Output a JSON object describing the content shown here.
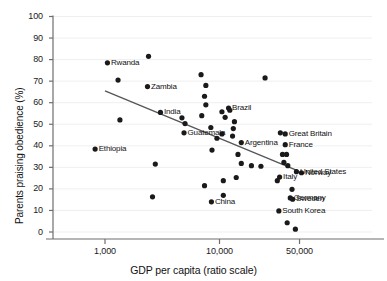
{
  "chart_data": {
    "type": "scatter",
    "title": "",
    "xlabel": "GDP per capita (ratio scale)",
    "ylabel": "Parents praising obedience (%)",
    "xscale": "log",
    "xlim": [
      600,
      100000
    ],
    "ylim": [
      0,
      100
    ],
    "grid": true,
    "legend": "none",
    "xticks": [
      {
        "value": 1000,
        "label": "1,000"
      },
      {
        "value": 10000,
        "label": "10,000"
      },
      {
        "value": 50000,
        "label": "50,000"
      }
    ],
    "yticks": [
      {
        "value": 0,
        "label": "0"
      },
      {
        "value": 10,
        "label": "10"
      },
      {
        "value": 20,
        "label": "20"
      },
      {
        "value": 30,
        "label": "30"
      },
      {
        "value": 40,
        "label": "40"
      },
      {
        "value": 50,
        "label": "50"
      },
      {
        "value": 60,
        "label": "60"
      },
      {
        "value": 70,
        "label": "70"
      },
      {
        "value": 80,
        "label": "80"
      },
      {
        "value": 90,
        "label": "90"
      },
      {
        "value": 100,
        "label": "100"
      }
    ],
    "trendline": {
      "x_start": 1000,
      "y_start": 65.5,
      "x_end": 48000,
      "y_end": 28.5,
      "color": "#555555"
    },
    "marker_color": "#1a1a1a",
    "points": [
      {
        "label": "Rwanda",
        "x": 1050,
        "y": 78.5,
        "label_pos": "right"
      },
      {
        "label": "Ethiopia",
        "x": 820,
        "y": 38.5,
        "label_pos": "right"
      },
      {
        "label": "Zambia",
        "x": 2350,
        "y": 67.5,
        "label_pos": "right"
      },
      {
        "label": "India",
        "x": 3050,
        "y": 55.5,
        "label_pos": "right"
      },
      {
        "label": "Guatemala",
        "x": 4900,
        "y": 46.0,
        "label_pos": "right"
      },
      {
        "label": "Brazil",
        "x": 12000,
        "y": 57.5,
        "label_pos": "right"
      },
      {
        "label": "Argentina",
        "x": 15500,
        "y": 41.5,
        "label_pos": "right"
      },
      {
        "label": "China",
        "x": 8500,
        "y": 14.0,
        "label_pos": "right"
      },
      {
        "label": "Great Britain",
        "x": 37500,
        "y": 45.5,
        "label_pos": "right"
      },
      {
        "label": "France",
        "x": 37500,
        "y": 40.5,
        "label_pos": "right"
      },
      {
        "label": "United States",
        "x": 47000,
        "y": 28.0,
        "label_pos": "right"
      },
      {
        "label": "Norway",
        "x": 52000,
        "y": 27.5,
        "label_pos": "right"
      },
      {
        "label": "Italy",
        "x": 33500,
        "y": 25.5,
        "label_pos": "right"
      },
      {
        "label": "Germany",
        "x": 41500,
        "y": 15.8,
        "label_pos": "right"
      },
      {
        "label": "Sweden",
        "x": 43500,
        "y": 15.2,
        "label_pos": "right"
      },
      {
        "label": "South Korea",
        "x": 33000,
        "y": 9.8,
        "label_pos": "right"
      },
      {
        "label": "",
        "x": 1300,
        "y": 70.5,
        "label_pos": "right"
      },
      {
        "label": "",
        "x": 1350,
        "y": 52.0,
        "label_pos": "right"
      },
      {
        "label": "",
        "x": 2400,
        "y": 81.5,
        "label_pos": "right"
      },
      {
        "label": "",
        "x": 2750,
        "y": 31.5,
        "label_pos": "right"
      },
      {
        "label": "",
        "x": 2600,
        "y": 16.3,
        "label_pos": "right"
      },
      {
        "label": "",
        "x": 4700,
        "y": 53.0,
        "label_pos": "right"
      },
      {
        "label": "",
        "x": 5000,
        "y": 50.3,
        "label_pos": "right"
      },
      {
        "label": "",
        "x": 6900,
        "y": 73.0,
        "label_pos": "right"
      },
      {
        "label": "",
        "x": 7600,
        "y": 68.0,
        "label_pos": "right"
      },
      {
        "label": "",
        "x": 7400,
        "y": 63.0,
        "label_pos": "right"
      },
      {
        "label": "",
        "x": 7600,
        "y": 59.0,
        "label_pos": "right"
      },
      {
        "label": "",
        "x": 7000,
        "y": 54.0,
        "label_pos": "right"
      },
      {
        "label": "",
        "x": 8400,
        "y": 48.5,
        "label_pos": "right"
      },
      {
        "label": "",
        "x": 9500,
        "y": 43.5,
        "label_pos": "right"
      },
      {
        "label": "",
        "x": 10500,
        "y": 45.5,
        "label_pos": "right"
      },
      {
        "label": "",
        "x": 7400,
        "y": 21.5,
        "label_pos": "right"
      },
      {
        "label": "",
        "x": 8600,
        "y": 38.0,
        "label_pos": "right"
      },
      {
        "label": "",
        "x": 10500,
        "y": 55.8,
        "label_pos": "right"
      },
      {
        "label": "",
        "x": 11200,
        "y": 53.2,
        "label_pos": "right"
      },
      {
        "label": "",
        "x": 12300,
        "y": 56.5,
        "label_pos": "right"
      },
      {
        "label": "",
        "x": 13500,
        "y": 51.2,
        "label_pos": "right"
      },
      {
        "label": "",
        "x": 13200,
        "y": 48.0,
        "label_pos": "right"
      },
      {
        "label": "",
        "x": 13000,
        "y": 44.5,
        "label_pos": "right"
      },
      {
        "label": "",
        "x": 14500,
        "y": 36.0,
        "label_pos": "right"
      },
      {
        "label": "",
        "x": 15500,
        "y": 31.8,
        "label_pos": "right"
      },
      {
        "label": "",
        "x": 10800,
        "y": 23.8,
        "label_pos": "right"
      },
      {
        "label": "",
        "x": 10800,
        "y": 17.0,
        "label_pos": "right"
      },
      {
        "label": "",
        "x": 14000,
        "y": 25.3,
        "label_pos": "right"
      },
      {
        "label": "",
        "x": 19000,
        "y": 30.8,
        "label_pos": "right"
      },
      {
        "label": "",
        "x": 23000,
        "y": 30.5,
        "label_pos": "right"
      },
      {
        "label": "",
        "x": 25000,
        "y": 71.5,
        "label_pos": "right"
      },
      {
        "label": "",
        "x": 34000,
        "y": 46.0,
        "label_pos": "right"
      },
      {
        "label": "",
        "x": 35500,
        "y": 36.0,
        "label_pos": "right"
      },
      {
        "label": "",
        "x": 38500,
        "y": 36.0,
        "label_pos": "right"
      },
      {
        "label": "",
        "x": 36500,
        "y": 32.3,
        "label_pos": "right"
      },
      {
        "label": "",
        "x": 39500,
        "y": 30.8,
        "label_pos": "right"
      },
      {
        "label": "",
        "x": 32000,
        "y": 23.8,
        "label_pos": "right"
      },
      {
        "label": "",
        "x": 43000,
        "y": 19.8,
        "label_pos": "right"
      },
      {
        "label": "",
        "x": 39000,
        "y": 4.3,
        "label_pos": "right"
      },
      {
        "label": "",
        "x": 46000,
        "y": 1.3,
        "label_pos": "right"
      }
    ]
  }
}
